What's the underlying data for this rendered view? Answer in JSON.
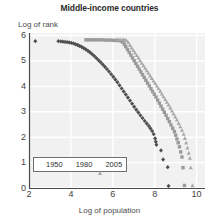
{
  "chart_data": {
    "type": "scatter",
    "title": "Middle-income countries",
    "xlabel": "Log of population",
    "ylabel": "Log of rank",
    "xlim": [
      2,
      10.4
    ],
    "ylim": [
      0,
      6.1
    ],
    "xticks": [
      2,
      4,
      6,
      8,
      10
    ],
    "yticks": [
      0,
      1,
      2,
      3,
      4,
      5,
      6
    ],
    "grid": true,
    "legend_position": "lower-left-inside",
    "colors": {
      "series_1950": "#4f4f4f",
      "series_1980": "#9a9a9a",
      "series_2005": "#a8a8a8",
      "plot_background": "#f1f1f1",
      "gridlines": "#ffffff",
      "axis": "#4a4a4a"
    },
    "series": [
      {
        "name": "1950",
        "marker": "diamond",
        "color": "#4f4f4f",
        "points": [
          [
            2.3,
            5.78
          ],
          [
            3.4,
            5.78
          ],
          [
            3.52,
            5.77
          ],
          [
            3.62,
            5.76
          ],
          [
            3.72,
            5.75
          ],
          [
            3.82,
            5.74
          ],
          [
            3.92,
            5.73
          ],
          [
            4.02,
            5.71
          ],
          [
            4.12,
            5.69
          ],
          [
            4.22,
            5.66
          ],
          [
            4.32,
            5.63
          ],
          [
            4.42,
            5.59
          ],
          [
            4.52,
            5.55
          ],
          [
            4.62,
            5.5
          ],
          [
            4.72,
            5.45
          ],
          [
            4.82,
            5.39
          ],
          [
            4.92,
            5.33
          ],
          [
            5.02,
            5.26
          ],
          [
            5.12,
            5.19
          ],
          [
            5.22,
            5.11
          ],
          [
            5.32,
            5.03
          ],
          [
            5.42,
            4.95
          ],
          [
            5.52,
            4.86
          ],
          [
            5.62,
            4.77
          ],
          [
            5.72,
            4.68
          ],
          [
            5.82,
            4.58
          ],
          [
            5.92,
            4.48
          ],
          [
            6.02,
            4.38
          ],
          [
            6.12,
            4.27
          ],
          [
            6.22,
            4.16
          ],
          [
            6.32,
            4.04
          ],
          [
            6.42,
            3.92
          ],
          [
            6.52,
            3.8
          ],
          [
            6.62,
            3.68
          ],
          [
            6.72,
            3.56
          ],
          [
            6.82,
            3.44
          ],
          [
            6.92,
            3.32
          ],
          [
            7.02,
            3.2
          ],
          [
            7.12,
            3.08
          ],
          [
            7.22,
            2.97
          ],
          [
            7.32,
            2.86
          ],
          [
            7.42,
            2.75
          ],
          [
            7.52,
            2.64
          ],
          [
            7.62,
            2.54
          ],
          [
            7.72,
            2.44
          ],
          [
            7.8,
            2.34
          ],
          [
            7.88,
            2.24
          ],
          [
            7.95,
            2.12
          ],
          [
            8.02,
            1.95
          ],
          [
            8.05,
            1.82
          ],
          [
            8.08,
            1.7
          ],
          [
            8.3,
            1.48
          ],
          [
            8.4,
            1.12
          ],
          [
            8.62,
            0.82
          ],
          [
            8.66,
            0.08
          ]
        ]
      },
      {
        "name": "1980",
        "marker": "square",
        "color": "#9a9a9a",
        "points": [
          [
            4.72,
            5.83
          ],
          [
            4.85,
            5.83
          ],
          [
            4.98,
            5.83
          ],
          [
            5.12,
            5.83
          ],
          [
            5.25,
            5.83
          ],
          [
            5.38,
            5.83
          ],
          [
            5.52,
            5.83
          ],
          [
            5.65,
            5.82
          ],
          [
            5.78,
            5.82
          ],
          [
            5.92,
            5.82
          ],
          [
            6.05,
            5.81
          ],
          [
            6.18,
            5.81
          ],
          [
            6.3,
            5.8
          ],
          [
            6.42,
            5.78
          ],
          [
            6.48,
            5.74
          ],
          [
            6.55,
            5.66
          ],
          [
            6.62,
            5.56
          ],
          [
            6.7,
            5.45
          ],
          [
            6.78,
            5.34
          ],
          [
            6.86,
            5.23
          ],
          [
            6.94,
            5.12
          ],
          [
            7.02,
            5.01
          ],
          [
            7.1,
            4.9
          ],
          [
            7.18,
            4.79
          ],
          [
            7.26,
            4.68
          ],
          [
            7.34,
            4.57
          ],
          [
            7.42,
            4.46
          ],
          [
            7.5,
            4.35
          ],
          [
            7.58,
            4.24
          ],
          [
            7.66,
            4.13
          ],
          [
            7.74,
            4.02
          ],
          [
            7.82,
            3.91
          ],
          [
            7.9,
            3.8
          ],
          [
            7.98,
            3.69
          ],
          [
            8.06,
            3.58
          ],
          [
            8.14,
            3.46
          ],
          [
            8.22,
            3.34
          ],
          [
            8.3,
            3.22
          ],
          [
            8.38,
            3.1
          ],
          [
            8.46,
            2.98
          ],
          [
            8.54,
            2.86
          ],
          [
            8.62,
            2.73
          ],
          [
            8.7,
            2.61
          ],
          [
            8.78,
            2.48
          ],
          [
            8.86,
            2.35
          ],
          [
            8.94,
            2.22
          ],
          [
            9.0,
            2.08
          ],
          [
            9.06,
            1.93
          ],
          [
            9.12,
            1.78
          ],
          [
            9.18,
            1.62
          ],
          [
            9.24,
            1.42
          ],
          [
            9.3,
            1.22
          ],
          [
            9.35,
            0.8
          ],
          [
            9.42,
            0.1
          ]
        ]
      },
      {
        "name": "2005",
        "marker": "triangle",
        "color": "#a8a8a8",
        "points": [
          [
            6.22,
            5.85
          ],
          [
            6.35,
            5.85
          ],
          [
            6.48,
            5.85
          ],
          [
            6.58,
            5.84
          ],
          [
            6.66,
            5.8
          ],
          [
            6.74,
            5.72
          ],
          [
            6.82,
            5.62
          ],
          [
            6.9,
            5.52
          ],
          [
            6.98,
            5.42
          ],
          [
            7.06,
            5.32
          ],
          [
            7.14,
            5.22
          ],
          [
            7.22,
            5.12
          ],
          [
            7.3,
            5.02
          ],
          [
            7.38,
            4.92
          ],
          [
            7.46,
            4.82
          ],
          [
            7.54,
            4.72
          ],
          [
            7.62,
            4.62
          ],
          [
            7.7,
            4.52
          ],
          [
            7.78,
            4.42
          ],
          [
            7.86,
            4.32
          ],
          [
            7.94,
            4.22
          ],
          [
            8.02,
            4.12
          ],
          [
            8.1,
            4.02
          ],
          [
            8.18,
            3.92
          ],
          [
            8.26,
            3.82
          ],
          [
            8.34,
            3.71
          ],
          [
            8.42,
            3.6
          ],
          [
            8.5,
            3.49
          ],
          [
            8.58,
            3.38
          ],
          [
            8.66,
            3.27
          ],
          [
            8.74,
            3.16
          ],
          [
            8.82,
            3.04
          ],
          [
            8.9,
            2.92
          ],
          [
            8.98,
            2.8
          ],
          [
            9.06,
            2.68
          ],
          [
            9.14,
            2.55
          ],
          [
            9.22,
            2.42
          ],
          [
            9.3,
            2.28
          ],
          [
            9.38,
            2.12
          ],
          [
            9.44,
            1.96
          ],
          [
            9.5,
            1.78
          ],
          [
            9.56,
            1.58
          ],
          [
            9.62,
            1.38
          ],
          [
            9.68,
            1.18
          ],
          [
            9.72,
            0.8
          ],
          [
            9.8,
            0.1
          ]
        ]
      }
    ]
  },
  "legend": {
    "items": [
      {
        "label": "1950",
        "marker": "diamond"
      },
      {
        "label": "1980",
        "marker": "square"
      },
      {
        "label": "2005",
        "marker": "triangle"
      }
    ]
  }
}
